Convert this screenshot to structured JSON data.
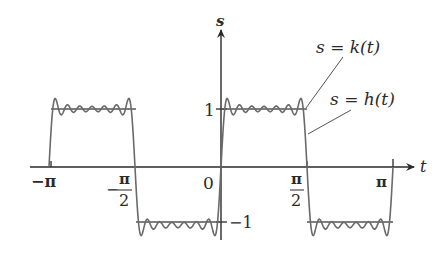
{
  "chart_data": {
    "type": "line",
    "title": "",
    "xlabel": "t",
    "ylabel": "s",
    "xlim": [
      -3.14159,
      3.14159
    ],
    "ylim": [
      -1,
      1
    ],
    "grid": false,
    "x_ticks": [
      {
        "value": -3.14159,
        "label": "−π"
      },
      {
        "value": -1.5708,
        "label": "−π/2"
      },
      {
        "value": 0,
        "label": "0"
      },
      {
        "value": 1.5708,
        "label": "π/2"
      },
      {
        "value": 3.14159,
        "label": "π"
      }
    ],
    "y_ticks": [
      {
        "value": 1,
        "label": "1"
      },
      {
        "value": -1,
        "label": "−1"
      }
    ],
    "series": [
      {
        "name": "s = k(t)",
        "description": "square wave: 1 on (−π,−π/2)∪(0,π/2), −1 on (−π/2,0)∪(π/2,π)",
        "x": [
          -3.14159,
          -1.5708,
          -1.5708,
          0,
          0,
          1.5708,
          1.5708,
          3.14159
        ],
        "y": [
          1,
          1,
          -1,
          -1,
          1,
          1,
          -1,
          -1
        ]
      },
      {
        "name": "s = h(t)",
        "description": "partial Fourier sum approximating k(t), showing Gibbs overshoot ripples",
        "terms": [
          1,
          3,
          5,
          7,
          9,
          11,
          13
        ]
      }
    ],
    "annotations": [
      {
        "text": "s = k(t)",
        "points_to": "upper plateau near t=π/2"
      },
      {
        "text": "s = h(t)",
        "points_to": "falling edge near t=π/2"
      }
    ]
  },
  "labels": {
    "s_axis": "s",
    "t_axis": "t",
    "neg_pi": "−π",
    "neg_pi_half_num": "π",
    "neg_pi_half_den": "2",
    "neg_sign": "−",
    "zero": "0",
    "pi_half_num": "π",
    "pi_half_den": "2",
    "pi": "π",
    "one": "1",
    "neg_one": "−1",
    "k_label_pre": "s = ",
    "k_label_fn": "k",
    "k_label_arg": "(t)",
    "h_label_pre": "s = ",
    "h_label_fn": "h",
    "h_label_arg": "(t)"
  },
  "colors": {
    "axis": "#2a2a2a",
    "square_wave": "#555555",
    "fourier_curve": "#6a6a6a"
  }
}
